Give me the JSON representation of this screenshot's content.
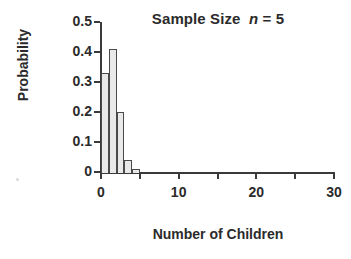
{
  "chart_data": {
    "type": "bar",
    "title": "Sample Size  n = 5",
    "title_prefix": "Sample Size  ",
    "title_symbol": "n",
    "title_suffix": " = 5",
    "xlabel": "Number of Children",
    "ylabel": "Probability",
    "x": [
      0,
      1,
      2,
      3,
      4,
      5
    ],
    "values": [
      0.33,
      0.41,
      0.2,
      0.04,
      0.01,
      0.002
    ],
    "categories": [
      "0",
      "1",
      "2",
      "3",
      "4",
      "5"
    ],
    "bar_width": 1,
    "xlim": [
      0,
      30
    ],
    "ylim": [
      0,
      0.5
    ],
    "xticks": [
      0,
      5,
      10,
      15,
      20,
      25,
      30
    ],
    "xtick_labels": [
      "0",
      "",
      "10",
      "",
      "20",
      "",
      "30"
    ],
    "yticks": [
      0,
      0.1,
      0.2,
      0.3,
      0.4,
      0.5
    ],
    "ytick_labels": [
      "0",
      "0.1",
      "0.2",
      "0.3",
      "0.4",
      "0.5"
    ],
    "grid": false,
    "legend": null,
    "bar_fill_color": "#e9e9e9",
    "bar_edge_color": "#4a4a4a",
    "axis_color": "#3a3a3a",
    "text_color": "#2b2b2b",
    "background_color": "#ffffff"
  }
}
